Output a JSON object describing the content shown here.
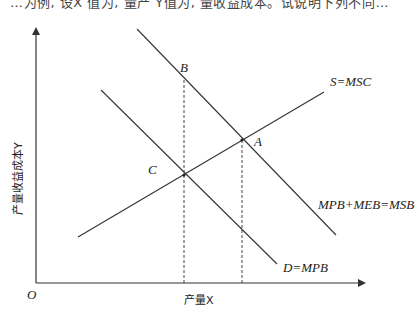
{
  "page": {
    "top_text_partial": "…为例, 设X 值为, 量产 Y值为, 量收益成本。试说明下列不同…"
  },
  "diagram": {
    "axes": {
      "x_label": "产量X",
      "y_label": "产量收益成本Y",
      "origin_label": "O"
    },
    "curves": [
      {
        "id": "msc",
        "label": "S=MSC",
        "from": [
          78,
          237
        ],
        "to": [
          324,
          92
        ],
        "style": "solid"
      },
      {
        "id": "msb",
        "label": "MPB+MEB=MSB",
        "from": [
          137,
          29
        ],
        "to": [
          336,
          235
        ],
        "style": "solid"
      },
      {
        "id": "mpb",
        "label": "D=MPB",
        "from": [
          101,
          90
        ],
        "to": [
          277,
          264
        ],
        "style": "solid"
      }
    ],
    "points": [
      {
        "id": "A",
        "label": "A",
        "x": 242,
        "y": 140
      },
      {
        "id": "B",
        "label": "B",
        "x": 184,
        "y": 80
      },
      {
        "id": "C",
        "label": "C",
        "x": 184,
        "y": 175
      }
    ],
    "dashed_lines": [
      {
        "from": [
          184,
          80
        ],
        "to": [
          184,
          283
        ]
      },
      {
        "from": [
          242,
          140
        ],
        "to": [
          242,
          283
        ]
      }
    ],
    "colors": {
      "line": "#333333",
      "text": "#222222"
    }
  }
}
